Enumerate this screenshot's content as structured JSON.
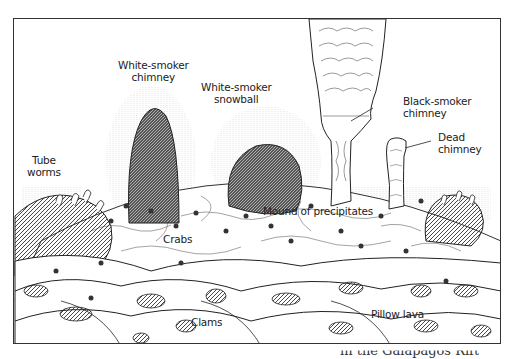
{
  "diagram": {
    "labels": {
      "white_smoker_chimney": [
        "White-smoker",
        "chimney"
      ],
      "white_smoker_snowball": [
        "White-smoker",
        "snowball"
      ],
      "black_smoker_chimney": [
        "Black-smoker",
        "chimney"
      ],
      "dead_chimney": [
        "Dead",
        "chimney"
      ],
      "tube_worms": [
        "Tube",
        "worms"
      ],
      "mound_of_precipitates": "Mound of precipitates",
      "crabs": "Crabs",
      "clams": "Clams",
      "pillow_lava": "Pillow lava"
    },
    "caption_fragment": "in the Galápagos Rift",
    "colors": {
      "ink": "#222222",
      "frame": "#333333",
      "background": "#ffffff"
    }
  }
}
